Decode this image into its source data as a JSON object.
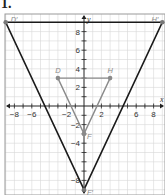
{
  "problem_number": "1.",
  "plane": {
    "x_range": [
      -9,
      9
    ],
    "y_range": [
      -9,
      9
    ],
    "grid_step": 1,
    "x_axis_label": "x",
    "y_axis_label": "y",
    "x_tick_labels": [
      {
        "value": -8,
        "text": "−8"
      },
      {
        "value": -6,
        "text": "−6"
      },
      {
        "value": -2,
        "text": "−2"
      },
      {
        "value": 2,
        "text": "2"
      },
      {
        "value": 6,
        "text": "6"
      },
      {
        "value": 8,
        "text": "8"
      }
    ],
    "y_tick_labels": [
      {
        "value": 8,
        "text": "8"
      },
      {
        "value": 6,
        "text": "6"
      },
      {
        "value": 4,
        "text": "4"
      },
      {
        "value": 2,
        "text": "2"
      },
      {
        "value": -2,
        "text": "−2"
      },
      {
        "value": -4,
        "text": "−4"
      },
      {
        "value": -8,
        "text": "−8"
      }
    ],
    "colors": {
      "grid": "#d6d6d6",
      "axis": "#222222",
      "original": "#8a8a8a",
      "image": "#1a1a1a"
    }
  },
  "figures": [
    {
      "name": "original-triangle",
      "color_key": "original",
      "vertices": [
        {
          "label": "D",
          "x": -3,
          "y": 3
        },
        {
          "label": "H",
          "x": 3,
          "y": 3
        },
        {
          "label": "F",
          "x": 0,
          "y": -3
        }
      ]
    },
    {
      "name": "image-triangle",
      "color_key": "image",
      "vertices": [
        {
          "label": "D′",
          "x": -9,
          "y": 9
        },
        {
          "label": "H′",
          "x": 9,
          "y": 9
        },
        {
          "label": "F′",
          "x": 0,
          "y": -9
        }
      ]
    }
  ]
}
